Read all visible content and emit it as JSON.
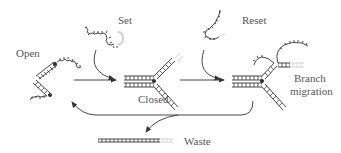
{
  "diagram": {
    "labels": {
      "open": "Open",
      "set": "Set",
      "reset": "Reset",
      "closed": "Closed",
      "branch": "Branch",
      "migration": "migration",
      "waste": "Waste"
    },
    "colors": {
      "stroke": "#333333",
      "faded": "#cfcfcf",
      "text": "#555555"
    }
  }
}
